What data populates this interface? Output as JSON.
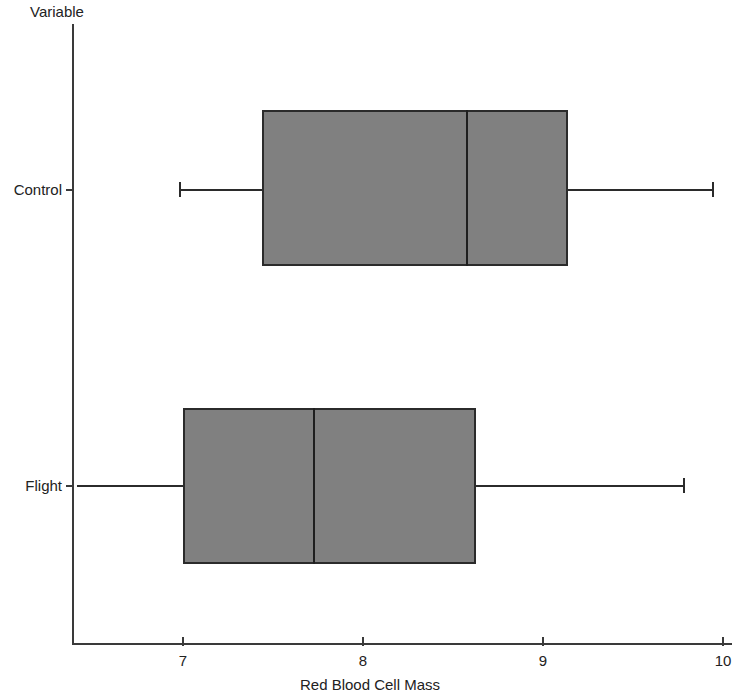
{
  "chart_data": {
    "type": "box",
    "title": "",
    "xlabel": "Red Blood Cell Mass",
    "ylabel": "Variable",
    "xlim": [
      6.41,
      10.05
    ],
    "xticks": [
      7,
      8,
      9,
      10
    ],
    "xtick_labels": [
      "7",
      "8",
      "9",
      "10"
    ],
    "categories": [
      "Control",
      "Flight"
    ],
    "grid": false,
    "legend": "none",
    "orientation": "horizontal",
    "boxes": [
      {
        "category": "Control",
        "whisker_low": 6.98,
        "q1": 7.44,
        "median": 8.57,
        "q3": 9.14,
        "whisker_high": 9.94,
        "low_cap_visible": true,
        "high_cap_visible": true
      },
      {
        "category": "Flight",
        "whisker_low": 6.41,
        "q1": 7.0,
        "median": 7.72,
        "q3": 8.63,
        "whisker_high": 9.78,
        "low_cap_visible": false,
        "high_cap_visible": true
      }
    ]
  },
  "colors": {
    "box_fill": "#808080",
    "box_border": "#2b2b2b",
    "axis": "#3a3a3a",
    "text": "#222222",
    "background": "#ffffff"
  },
  "axis": {
    "y_title": "Variable",
    "x_title": "Red Blood Cell Mass",
    "category_labels": [
      "Control",
      "Flight"
    ],
    "value_tick_labels": [
      "7",
      "8",
      "9",
      "10"
    ]
  }
}
